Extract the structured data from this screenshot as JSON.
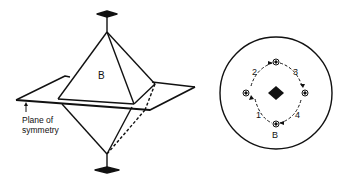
{
  "figure_left": {
    "face_label": "B",
    "plane_label_line1": "Plane of",
    "plane_label_line2": "symmetry"
  },
  "figure_right": {
    "center_symbol": "2-fold axis (diamond)",
    "positions": [
      {
        "label": "1"
      },
      {
        "label": "2"
      },
      {
        "label": "3"
      },
      {
        "label": "4"
      }
    ],
    "bottom_label": "B"
  },
  "colors": {
    "ink": "#111111",
    "background": "#ffffff"
  }
}
